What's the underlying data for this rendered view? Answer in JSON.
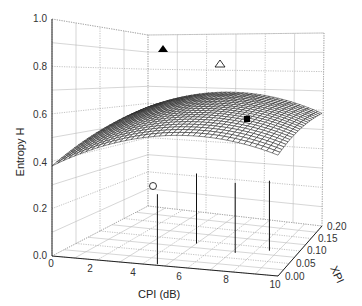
{
  "chart_data": {
    "type": "surface3d",
    "title": "",
    "xlabel": "CPI (dB)",
    "ylabel": "XPI",
    "zlabel": "Entropy H",
    "x_ticks": [
      "0",
      "2",
      "4",
      "6",
      "8",
      "10"
    ],
    "y_ticks": [
      "0.00",
      "0.05",
      "0.10",
      "0.15",
      "0.20"
    ],
    "z_ticks": [
      "0.0",
      "0.2",
      "0.4",
      "0.6",
      "0.8",
      "1.0"
    ],
    "xlim": [
      0,
      10
    ],
    "ylim": [
      0,
      0.2
    ],
    "zlim": [
      0,
      1.0
    ],
    "grid": true,
    "surface_description": "Dome-shaped mesh surface of entropy H over CPI and XPI; ~0.38 at CPI=0/XPI=0, rising to ~0.75 near CPI 5-6 at high XPI, ~0.5-0.6 at CPI=10",
    "markers": [
      {
        "symbol": "filled-triangle",
        "cpi": 5,
        "xpi": 0.2,
        "h": 0.76
      },
      {
        "symbol": "open-triangle",
        "cpi": 7,
        "xpi": 0.18,
        "h": 0.72
      },
      {
        "symbol": "filled-square",
        "cpi": 8.5,
        "xpi": 0.16,
        "h": 0.66
      },
      {
        "symbol": "open-circle",
        "cpi": 4.5,
        "xpi": 0.0,
        "h": 0.32
      }
    ]
  }
}
